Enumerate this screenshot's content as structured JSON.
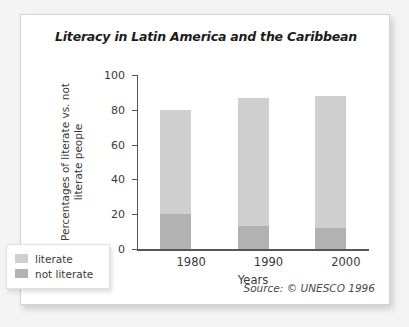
{
  "chart_data": {
    "type": "bar",
    "subtype": "stacked-column",
    "title": "Literacy in Latin America and the Caribbean",
    "xlabel": "Years",
    "ylabel": "Percentages of literate vs. not literate people",
    "ylabel_lines": [
      "Percentages of literate vs.  not",
      "literate people"
    ],
    "categories": [
      "1980",
      "1990",
      "2000"
    ],
    "series": [
      {
        "name": "not literate",
        "values": [
          20,
          13,
          12
        ],
        "color": "#b2b2b2"
      },
      {
        "name": "literate",
        "values": [
          60,
          74,
          76
        ],
        "color": "#cfcfcf"
      }
    ],
    "stack_totals": [
      80,
      87,
      88
    ],
    "ylim": [
      0,
      100
    ],
    "yticks": [
      0,
      20,
      40,
      60,
      80,
      100
    ],
    "ytick_labels": [
      "0",
      "20",
      "40",
      "60",
      "80",
      "100"
    ],
    "grid": false,
    "legend_position": "bottom-left-outside",
    "legend_entries": [
      "literate",
      "not literate"
    ],
    "annotations": [
      "Source: © UNESCO 1996"
    ]
  },
  "source_note": "Source: © UNESCO 1996"
}
